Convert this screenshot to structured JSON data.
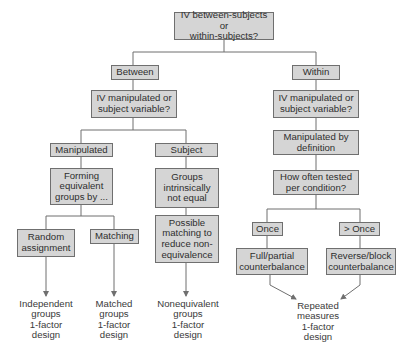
{
  "diagram": {
    "root": "IV between-subjects or\nwithin-subjects?",
    "between": {
      "label": "Between",
      "question": "IV manipulated or\nsubject variable?",
      "manipulated": {
        "label": "Manipulated",
        "forming": "Forming\nequivalent\ngroups by ...",
        "random": "Random\nassignment",
        "matching": "Matching",
        "outcome_random": "Independent\ngroups\n1-factor\ndesign",
        "outcome_matching": "Matched\ngroups\n1-factor\ndesign"
      },
      "subject": {
        "label": "Subject",
        "groups": "Groups\nintrinsically\nnot equal",
        "possible": "Possible\nmatching to\nreduce non-\nequivalence",
        "outcome": "Nonequivalent\ngroups\n1-factor\ndesign"
      }
    },
    "within": {
      "label": "Within",
      "question": "IV manipulated or\nsubject variable?",
      "manipulated_def": "Manipulated by\ndefinition",
      "how_often": "How often tested\nper condition?",
      "once": "Once",
      "more_than_once": "> Once",
      "full_partial": "Full/partial\ncounterbalance",
      "reverse_block": "Reverse/block\ncounterbalance",
      "outcome": "Repeated\nmeasures\n1-factor\ndesign"
    }
  }
}
